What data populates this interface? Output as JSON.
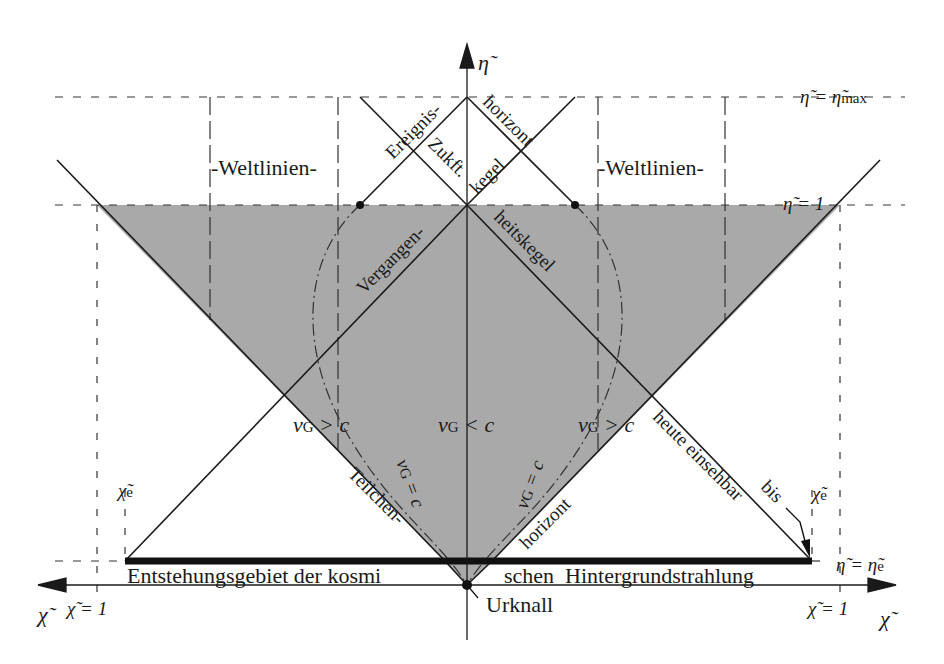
{
  "diagram": {
    "axes": {
      "y_label": "η̃",
      "x_label": "χ̃",
      "x_label_left": "χ̃"
    },
    "level_labels": {
      "eta_max": "η̃ = η̃max",
      "eta_max_main": "η̃ = η̃",
      "eta_max_sub": "max",
      "eta_one": "η̃ = 1",
      "eta_e_main": "η̃ = η̃",
      "eta_e_sub": "e"
    },
    "tick_labels": {
      "chi_one_left": "χ̃ = 1",
      "chi_one_right": "χ̃ = 1",
      "chi_e_left_main": "χ̃",
      "chi_e_left_sub": "e",
      "chi_e_right_main": "χ̃",
      "chi_e_right_sub": "e"
    },
    "region_labels": {
      "worldlines_left": "-Weltlinien-",
      "worldlines_right": "-Weltlinien-",
      "event_horizon_1": "Ereignis-",
      "event_horizon_2": "horizont",
      "future_cone_1": "Zukft.",
      "future_cone_2": "kegel",
      "past_cone_1": "Vergangen-",
      "past_cone_2": "heitskegel",
      "particle_horizon_1": "Teilchen-",
      "particle_horizon_2": "horizont",
      "visible_today": "heute einsehbar",
      "until": "bis",
      "cmb_left": "Entstehungsgebiet der kosmi",
      "cmb_right": "schen  Hintergrundstrahlung",
      "big_bang": "Urknall"
    },
    "velocity_labels": {
      "v_main": "v",
      "v_sub": "G",
      "left_gt": " > c",
      "center_lt": " < c",
      "right_gt": " > c",
      "eq_left": " = c",
      "eq_right": " = c"
    },
    "colors": {
      "shade": "#a9a9a9",
      "line": "#1a1a1a",
      "background": "#ffffff"
    }
  }
}
